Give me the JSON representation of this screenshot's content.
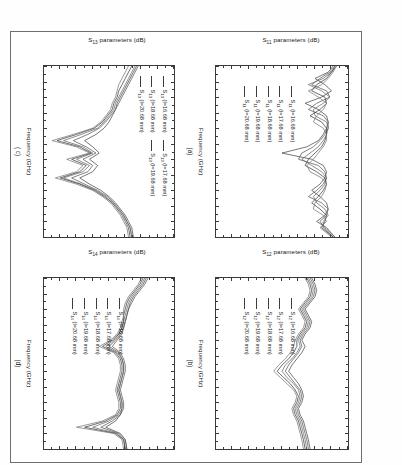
{
  "figure": {
    "axis_label_suffix": "parameters (dB)",
    "xaxis_label": "Frequency (GHz)",
    "xticks": [
      "2.0",
      "2.5",
      "3.0",
      "3.5",
      "4.0",
      "4.5",
      "5.0",
      "5.5",
      "6.0",
      "6.5",
      "7.0",
      "7.5"
    ],
    "yticks": [
      "0",
      "-10",
      "-20",
      "-30",
      "-40",
      "-50",
      "-60",
      "-70",
      "-80"
    ],
    "xlim": [
      2.0,
      7.5
    ],
    "ylim": [
      -80,
      0
    ]
  },
  "panels": [
    {
      "tag": "(a)",
      "param": "S",
      "sub": "11",
      "ylabel_main": "S",
      "ylabel_sub": "11",
      "ylabel_rest": " parameters (dB)",
      "legend_layout": "single",
      "legend": [
        {
          "series": "S",
          "sub": "11",
          "cond": " (l=16.68 mm)"
        },
        {
          "series": "S",
          "sub": "11",
          "cond": " (l=17.68 mm)"
        },
        {
          "series": "S",
          "sub": "11",
          "cond": " (l=18.68 mm)"
        },
        {
          "series": "S",
          "sub": "11",
          "cond": " (l=19.68 mm)"
        },
        {
          "series": "S",
          "sub": "11",
          "cond": " (l=20.68 mm)"
        }
      ]
    },
    {
      "tag": "(b)",
      "param": "S",
      "sub": "12",
      "ylabel_main": "S",
      "ylabel_sub": "12",
      "ylabel_rest": " parameters (dB)",
      "legend_layout": "single",
      "legend": [
        {
          "series": "S",
          "sub": "12",
          "cond": " (l=16.68 mm)"
        },
        {
          "series": "S",
          "sub": "12",
          "cond": " (l=17.68 mm)"
        },
        {
          "series": "S",
          "sub": "12",
          "cond": " (l=18.68 mm)"
        },
        {
          "series": "S",
          "sub": "12",
          "cond": " (l=19.68 mm)"
        },
        {
          "series": "S",
          "sub": "12",
          "cond": " (l=20.68 mm)"
        }
      ]
    },
    {
      "tag": "( c)",
      "param": "S",
      "sub": "13",
      "ylabel_main": "S",
      "ylabel_sub": "13",
      "ylabel_rest": " parameters (dB)",
      "legend_layout": "two-column",
      "legend": [
        {
          "series": "S",
          "sub": "13",
          "cond": " (l=16.68 mm)"
        },
        {
          "series": "S",
          "sub": "13",
          "cond": " (l=18.68 mm)"
        },
        {
          "series": "S",
          "sub": "13",
          "cond": " (l=20.68 mm)"
        },
        {
          "series": "S",
          "sub": "13",
          "cond": " (l=17.68 mm)"
        },
        {
          "series": "S",
          "sub": "13",
          "cond": " (l=19.68 mm)"
        }
      ]
    },
    {
      "tag": "(d)",
      "param": "S",
      "sub": "14",
      "ylabel_main": "S",
      "ylabel_sub": "14",
      "ylabel_rest": " parameters (dB)",
      "legend_layout": "single",
      "legend": [
        {
          "series": "S",
          "sub": "14",
          "cond": " (l=16.68 mm)"
        },
        {
          "series": "S",
          "sub": "14",
          "cond": " (l=17.68 mm)"
        },
        {
          "series": "S",
          "sub": "14",
          "cond": " (l=18.68 mm)"
        },
        {
          "series": "S",
          "sub": "14",
          "cond": " (l=19.68 mm)"
        },
        {
          "series": "S",
          "sub": "14",
          "cond": " (l=20.68 mm)"
        }
      ]
    }
  ],
  "chart_data": [
    {
      "type": "line",
      "title": "(a)",
      "xlabel": "Frequency (GHz)",
      "ylabel": "S11 parameters (dB)",
      "xlim": [
        2.0,
        7.5
      ],
      "ylim": [
        -80,
        0
      ],
      "grid": false,
      "legend_position": "inside-lower-left",
      "x": [
        2.0,
        2.2,
        2.4,
        2.6,
        2.8,
        3.0,
        3.2,
        3.4,
        3.6,
        3.8,
        4.0,
        4.2,
        4.4,
        4.6,
        4.8,
        5.0,
        5.2,
        5.4,
        5.6,
        5.8,
        6.0,
        6.2,
        6.4,
        6.6,
        6.8,
        7.0,
        7.2,
        7.5
      ],
      "series": [
        {
          "name": "S11 (l=16.68 mm)",
          "values": [
            -9,
            -12,
            -20,
            -14,
            -10,
            -16,
            -26,
            -18,
            -13,
            -12,
            -13,
            -15,
            -18,
            -25,
            -40,
            -22,
            -15,
            -13,
            -14,
            -17,
            -22,
            -17,
            -13,
            -12,
            -14,
            -19,
            -13,
            -8
          ]
        },
        {
          "name": "S11 (l=17.68 mm)",
          "values": [
            -8,
            -11,
            -17,
            -22,
            -13,
            -11,
            -19,
            -24,
            -15,
            -12,
            -12,
            -14,
            -17,
            -21,
            -28,
            -30,
            -18,
            -14,
            -13,
            -15,
            -19,
            -24,
            -16,
            -12,
            -13,
            -17,
            -14,
            -8
          ]
        },
        {
          "name": "S11 (l=18.68 mm)",
          "values": [
            -8,
            -10,
            -15,
            -24,
            -16,
            -11,
            -15,
            -21,
            -20,
            -13,
            -12,
            -13,
            -15,
            -18,
            -23,
            -28,
            -22,
            -16,
            -13,
            -14,
            -17,
            -21,
            -19,
            -14,
            -12,
            -15,
            -15,
            -9
          ]
        },
        {
          "name": "S11 (l=19.68 mm)",
          "values": [
            -7,
            -10,
            -13,
            -19,
            -22,
            -14,
            -13,
            -17,
            -23,
            -16,
            -13,
            -13,
            -14,
            -16,
            -20,
            -24,
            -26,
            -19,
            -14,
            -13,
            -15,
            -18,
            -22,
            -17,
            -13,
            -14,
            -16,
            -9
          ]
        },
        {
          "name": "S11 (l=20.68 mm)",
          "values": [
            -7,
            -9,
            -12,
            -16,
            -24,
            -18,
            -13,
            -15,
            -19,
            -21,
            -15,
            -13,
            -13,
            -15,
            -18,
            -21,
            -25,
            -23,
            -16,
            -13,
            -14,
            -16,
            -20,
            -21,
            -15,
            -13,
            -17,
            -10
          ]
        }
      ]
    },
    {
      "type": "line",
      "title": "(b)",
      "xlabel": "Frequency (GHz)",
      "ylabel": "S12 parameters (dB)",
      "xlim": [
        2.0,
        7.5
      ],
      "ylim": [
        -80,
        0
      ],
      "grid": false,
      "legend_position": "inside-lower-left",
      "x": [
        2.0,
        2.2,
        2.4,
        2.6,
        2.8,
        3.0,
        3.2,
        3.4,
        3.6,
        3.8,
        4.0,
        4.2,
        4.4,
        4.6,
        4.8,
        5.0,
        5.2,
        5.4,
        5.6,
        5.8,
        6.0,
        6.2,
        6.4,
        6.6,
        6.8,
        7.0,
        7.2,
        7.5
      ],
      "series": [
        {
          "name": "S12 (l=16.68 mm)",
          "values": [
            -22,
            -20,
            -19,
            -20,
            -23,
            -26,
            -24,
            -22,
            -23,
            -26,
            -28,
            -26,
            -28,
            -31,
            -34,
            -36,
            -33,
            -30,
            -28,
            -27,
            -28,
            -30,
            -29,
            -27,
            -26,
            -25,
            -24,
            -23
          ]
        },
        {
          "name": "S12 (l=17.68 mm)",
          "values": [
            -23,
            -21,
            -20,
            -21,
            -24,
            -27,
            -25,
            -23,
            -24,
            -27,
            -29,
            -28,
            -30,
            -33,
            -36,
            -38,
            -35,
            -32,
            -29,
            -28,
            -29,
            -31,
            -30,
            -28,
            -27,
            -26,
            -25,
            -24
          ]
        },
        {
          "name": "S12 (l=18.68 mm)",
          "values": [
            -24,
            -22,
            -21,
            -22,
            -25,
            -28,
            -26,
            -24,
            -25,
            -28,
            -30,
            -29,
            -31,
            -34,
            -38,
            -40,
            -37,
            -33,
            -30,
            -29,
            -30,
            -32,
            -31,
            -29,
            -28,
            -27,
            -26,
            -25
          ]
        },
        {
          "name": "S12 (l=19.68 mm)",
          "values": [
            -25,
            -23,
            -22,
            -23,
            -26,
            -29,
            -27,
            -25,
            -26,
            -29,
            -31,
            -31,
            -33,
            -36,
            -40,
            -43,
            -39,
            -35,
            -32,
            -30,
            -31,
            -33,
            -32,
            -30,
            -29,
            -28,
            -27,
            -26
          ]
        },
        {
          "name": "S12 (l=20.68 mm)",
          "values": [
            -26,
            -24,
            -23,
            -24,
            -27,
            -30,
            -28,
            -26,
            -27,
            -30,
            -32,
            -33,
            -35,
            -38,
            -42,
            -45,
            -41,
            -37,
            -33,
            -31,
            -32,
            -34,
            -33,
            -31,
            -30,
            -29,
            -28,
            -27
          ]
        }
      ]
    },
    {
      "type": "line",
      "title": "( c)",
      "xlabel": "Frequency (GHz)",
      "ylabel": "S13 parameters (dB)",
      "xlim": [
        2.0,
        7.5
      ],
      "ylim": [
        -80,
        0
      ],
      "grid": false,
      "legend_position": "inside-upper-left",
      "x": [
        2.0,
        2.2,
        2.4,
        2.6,
        2.8,
        3.0,
        3.2,
        3.4,
        3.6,
        3.8,
        4.0,
        4.2,
        4.4,
        4.6,
        4.8,
        5.0,
        5.2,
        5.4,
        5.6,
        5.8,
        6.0,
        6.2,
        6.4,
        6.6,
        6.8,
        7.0,
        7.2,
        7.5
      ],
      "series": [
        {
          "name": "S13 (l=16.68 mm)",
          "values": [
            -23,
            -25,
            -27,
            -29,
            -31,
            -33,
            -35,
            -36,
            -38,
            -40,
            -43,
            -48,
            -55,
            -50,
            -46,
            -52,
            -47,
            -50,
            -58,
            -52,
            -45,
            -40,
            -36,
            -33,
            -30,
            -28,
            -26,
            -25
          ]
        },
        {
          "name": "S13 (l=17.68 mm)",
          "values": [
            -22,
            -24,
            -26,
            -28,
            -30,
            -32,
            -34,
            -36,
            -39,
            -42,
            -46,
            -53,
            -62,
            -54,
            -48,
            -56,
            -50,
            -53,
            -63,
            -55,
            -47,
            -41,
            -37,
            -34,
            -31,
            -29,
            -27,
            -26
          ]
        },
        {
          "name": "S13 (l=18.68 mm)",
          "values": [
            -24,
            -26,
            -28,
            -30,
            -32,
            -34,
            -36,
            -37,
            -40,
            -43,
            -47,
            -57,
            -68,
            -56,
            -50,
            -60,
            -52,
            -56,
            -68,
            -57,
            -48,
            -42,
            -38,
            -34,
            -31,
            -29,
            -27,
            -26
          ]
        },
        {
          "name": "S13 (l=19.68 mm)",
          "values": [
            -26,
            -28,
            -30,
            -32,
            -34,
            -35,
            -37,
            -38,
            -41,
            -44,
            -49,
            -60,
            -72,
            -58,
            -51,
            -63,
            -54,
            -58,
            -70,
            -58,
            -49,
            -43,
            -38,
            -35,
            -32,
            -30,
            -28,
            -27
          ]
        },
        {
          "name": "S13 (l=20.68 mm)",
          "values": [
            -28,
            -30,
            -32,
            -34,
            -35,
            -36,
            -38,
            -39,
            -42,
            -45,
            -50,
            -62,
            -75,
            -60,
            -52,
            -66,
            -56,
            -60,
            -73,
            -60,
            -50,
            -44,
            -39,
            -36,
            -33,
            -31,
            -29,
            -28
          ]
        }
      ]
    },
    {
      "type": "line",
      "title": "(d)",
      "xlabel": "Frequency (GHz)",
      "ylabel": "S14 parameters (dB)",
      "xlim": [
        2.0,
        7.5
      ],
      "ylim": [
        -80,
        0
      ],
      "grid": false,
      "legend_position": "inside-lower-left",
      "x": [
        2.0,
        2.2,
        2.4,
        2.6,
        2.8,
        3.0,
        3.2,
        3.4,
        3.6,
        3.8,
        4.0,
        4.2,
        4.4,
        4.6,
        4.8,
        5.0,
        5.2,
        5.4,
        5.6,
        5.8,
        6.0,
        6.2,
        6.4,
        6.6,
        6.8,
        7.0,
        7.2,
        7.5
      ],
      "series": [
        {
          "name": "S14 (l=16.68 mm)",
          "values": [
            -17,
            -19,
            -22,
            -25,
            -27,
            -28,
            -29,
            -30,
            -31,
            -33,
            -36,
            -40,
            -34,
            -32,
            -31,
            -31,
            -32,
            -33,
            -34,
            -33,
            -32,
            -32,
            -33,
            -36,
            -42,
            -33,
            -30,
            -29
          ]
        },
        {
          "name": "S14 (l=17.68 mm)",
          "values": [
            -16,
            -18,
            -21,
            -24,
            -26,
            -28,
            -29,
            -30,
            -31,
            -32,
            -35,
            -38,
            -33,
            -31,
            -30,
            -30,
            -31,
            -32,
            -33,
            -32,
            -31,
            -31,
            -33,
            -38,
            -45,
            -34,
            -30,
            -29
          ]
        },
        {
          "name": "S14 (l=18.68 mm)",
          "values": [
            -18,
            -20,
            -23,
            -26,
            -28,
            -29,
            -30,
            -31,
            -32,
            -34,
            -37,
            -42,
            -35,
            -32,
            -31,
            -31,
            -32,
            -33,
            -34,
            -33,
            -32,
            -32,
            -34,
            -40,
            -50,
            -35,
            -31,
            -30
          ]
        },
        {
          "name": "S14 (l=19.68 mm)",
          "values": [
            -19,
            -21,
            -24,
            -27,
            -29,
            -30,
            -31,
            -31,
            -32,
            -34,
            -38,
            -44,
            -36,
            -33,
            -32,
            -32,
            -33,
            -34,
            -35,
            -34,
            -33,
            -33,
            -35,
            -42,
            -55,
            -36,
            -31,
            -30
          ]
        },
        {
          "name": "S14 (l=20.68 mm)",
          "values": [
            -20,
            -22,
            -25,
            -28,
            -30,
            -31,
            -31,
            -32,
            -33,
            -35,
            -39,
            -46,
            -37,
            -34,
            -33,
            -33,
            -34,
            -35,
            -36,
            -35,
            -34,
            -34,
            -36,
            -44,
            -60,
            -37,
            -32,
            -31
          ]
        }
      ]
    }
  ]
}
